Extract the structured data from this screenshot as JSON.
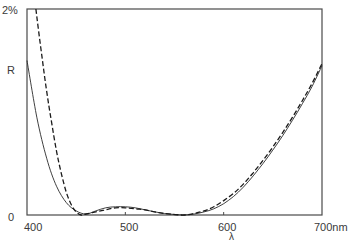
{
  "chart_data": {
    "type": "line",
    "title": "",
    "xlabel": "λ",
    "ylabel": "R",
    "xunit": "nm",
    "xlim": [
      400,
      700
    ],
    "ylim": [
      0,
      2
    ],
    "x_ticks": [
      "400",
      "500",
      "600",
      "700nm"
    ],
    "y_ticks": [
      "0",
      "2%"
    ],
    "grid": false,
    "legend": null,
    "series": [
      {
        "name": "solid",
        "style": "solid",
        "x": [
          400,
          410,
          420,
          430,
          440,
          450,
          460,
          470,
          480,
          490,
          500,
          510,
          520,
          530,
          540,
          550,
          560,
          570,
          580,
          590,
          600,
          610,
          620,
          630,
          640,
          650,
          660,
          670,
          680,
          690,
          700
        ],
        "values": [
          1.5,
          0.95,
          0.55,
          0.28,
          0.12,
          0.04,
          0.01,
          0.04,
          0.07,
          0.08,
          0.08,
          0.07,
          0.05,
          0.03,
          0.015,
          0.005,
          0.0,
          0.01,
          0.03,
          0.06,
          0.11,
          0.18,
          0.27,
          0.38,
          0.5,
          0.63,
          0.77,
          0.92,
          1.08,
          1.25,
          1.45
        ]
      },
      {
        "name": "dashed",
        "style": "dashed",
        "x": [
          409,
          415,
          420,
          425,
          430,
          435,
          440,
          445,
          450,
          455,
          460,
          470,
          480,
          490,
          500,
          510,
          520,
          530,
          540,
          550,
          560,
          570,
          580,
          590,
          600,
          610,
          620,
          630,
          640,
          650,
          660,
          670,
          680,
          690,
          700
        ],
        "values": [
          2.0,
          1.55,
          1.2,
          0.9,
          0.62,
          0.4,
          0.22,
          0.1,
          0.03,
          0.0,
          0.01,
          0.03,
          0.05,
          0.07,
          0.07,
          0.06,
          0.05,
          0.03,
          0.015,
          0.005,
          0.0,
          0.015,
          0.04,
          0.08,
          0.14,
          0.21,
          0.3,
          0.41,
          0.53,
          0.66,
          0.8,
          0.95,
          1.11,
          1.28,
          1.47
        ]
      }
    ]
  },
  "axes": {
    "y_top_label": "2%",
    "y_zero_label": "0",
    "y_axis_label": "R",
    "x_tick_labels": [
      "400",
      "500",
      "600",
      "700nm"
    ],
    "x_axis_label": "λ"
  },
  "colors": {
    "ink": "#2a2a2a",
    "frame": "#4a4a4a",
    "background": "#ffffff"
  }
}
